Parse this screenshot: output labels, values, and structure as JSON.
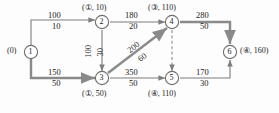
{
  "diagram": {
    "type": "network-flow-graph",
    "title_visible": false,
    "colors": {
      "edge": "#7d7d7d",
      "highlight": "#8a8a8a",
      "text": "#1a1a1a",
      "node_stroke": "#6e6e6e",
      "background": "#fdfdfd"
    },
    "nodes": [
      {
        "id": "1",
        "label": "1",
        "state": "(0)",
        "state_pos": "left",
        "x": 31,
        "y": 52
      },
      {
        "id": "2",
        "label": "2",
        "state": "(①, 10)",
        "state_pos": "top",
        "x": 102,
        "y": 22
      },
      {
        "id": "3",
        "label": "3",
        "state": "(①, 50)",
        "state_pos": "bottom",
        "x": 102,
        "y": 78
      },
      {
        "id": "4",
        "label": "4",
        "state": "(③, 110)",
        "state_pos": "top",
        "x": 172,
        "y": 22
      },
      {
        "id": "5",
        "label": "5",
        "state": "(④, 110)",
        "state_pos": "bottom",
        "x": 172,
        "y": 78
      },
      {
        "id": "6",
        "label": "6",
        "state": "(④, 160)",
        "state_pos": "right",
        "x": 230,
        "y": 52
      }
    ],
    "edges": [
      {
        "from": "1",
        "to": "2",
        "capacity": "100",
        "flow": "10",
        "style": "solid",
        "highlighted": false
      },
      {
        "from": "1",
        "to": "3",
        "capacity": "150",
        "flow": "50",
        "style": "solid",
        "highlighted": true
      },
      {
        "from": "2",
        "to": "4",
        "capacity": "180",
        "flow": "20",
        "style": "solid",
        "highlighted": false
      },
      {
        "from": "2",
        "to": "3",
        "capacity": "100",
        "flow": "30",
        "style": "solid",
        "highlighted": false
      },
      {
        "from": "3",
        "to": "4",
        "capacity": "200",
        "flow": "60",
        "style": "solid",
        "highlighted": true
      },
      {
        "from": "3",
        "to": "5",
        "capacity": "350",
        "flow": "50",
        "style": "solid",
        "highlighted": false
      },
      {
        "from": "4",
        "to": "6",
        "capacity": "280",
        "flow": "50",
        "style": "solid",
        "highlighted": true
      },
      {
        "from": "4",
        "to": "5",
        "capacity": "",
        "flow": "",
        "style": "dashed",
        "highlighted": false
      },
      {
        "from": "5",
        "to": "6",
        "capacity": "170",
        "flow": "30",
        "style": "solid",
        "highlighted": false
      }
    ]
  }
}
